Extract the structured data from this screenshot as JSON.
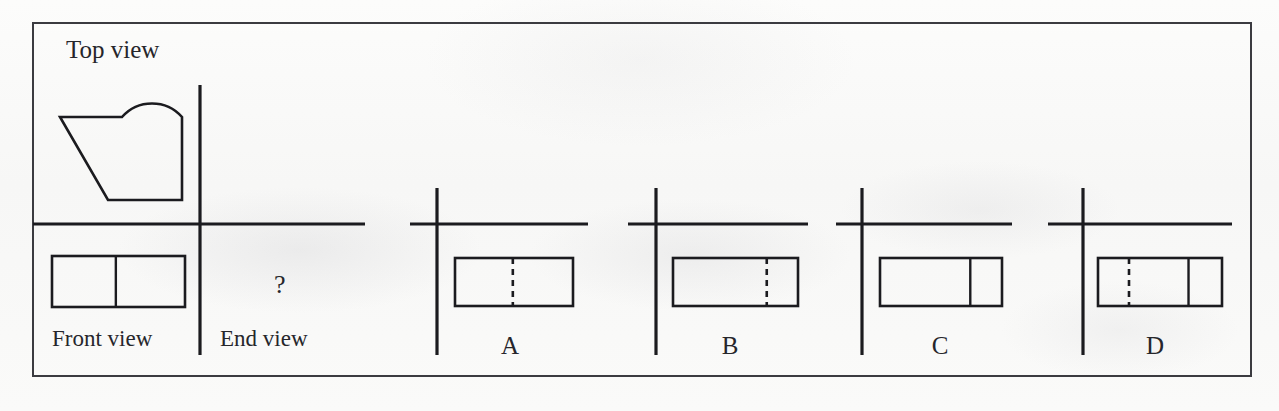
{
  "document": {
    "kind": "orthographic-projection-multiple-choice",
    "background_color": "#fbfbfa",
    "ink_color": "#1b1b1f",
    "border_color": "#3b3b40"
  },
  "given_views": {
    "top_view_label": "Top view",
    "front_view_label": "Front view",
    "end_view_label": "End view",
    "unknown_marker": "?"
  },
  "chart_data": {
    "type": "diagram",
    "title": "Top view",
    "xlabel": "",
    "ylabel": "",
    "grid": false,
    "legend": null
  },
  "top_view": {
    "name": "top-view-profile",
    "description": "plan outline with semicircular boss, concave notch, and tapered diagonal flank",
    "path": "M 60 117 L 122 117 A 40 40 0 0 1 182 117 L 182 200 L 108 200 Z"
  },
  "front_view": {
    "name": "front-view-rectangle",
    "x": 52,
    "y": 256,
    "width": 133,
    "height": 51,
    "divider": {
      "position_pct": 48,
      "style": "solid"
    }
  },
  "axes": {
    "main": {
      "vertical": {
        "x": 200,
        "y1": 85,
        "y2": 355
      },
      "horizontal": {
        "y": 224,
        "x1": 33,
        "x2": 365
      }
    }
  },
  "options": [
    {
      "label": "A",
      "label_x": 510,
      "axis_vertical_x": 437,
      "axis_vertical_y1": 188,
      "axis_vertical_y2": 355,
      "axis_horizontal_y": 224,
      "axis_horizontal_x1": 410,
      "axis_horizontal_x2": 588,
      "rect": {
        "x": 455,
        "y": 258,
        "width": 118,
        "height": 48
      },
      "dividers": [
        {
          "position_pct": 49,
          "style": "hidden"
        }
      ]
    },
    {
      "label": "B",
      "label_x": 730,
      "axis_vertical_x": 656,
      "axis_vertical_y1": 188,
      "axis_vertical_y2": 355,
      "axis_horizontal_y": 224,
      "axis_horizontal_x1": 628,
      "axis_horizontal_x2": 808,
      "rect": {
        "x": 673,
        "y": 258,
        "width": 125,
        "height": 48
      },
      "dividers": [
        {
          "position_pct": 75,
          "style": "hidden"
        }
      ]
    },
    {
      "label": "C",
      "label_x": 940,
      "axis_vertical_x": 862,
      "axis_vertical_y1": 188,
      "axis_vertical_y2": 355,
      "axis_horizontal_y": 224,
      "axis_horizontal_x1": 836,
      "axis_horizontal_x2": 1012,
      "rect": {
        "x": 880,
        "y": 258,
        "width": 122,
        "height": 48
      },
      "dividers": [
        {
          "position_pct": 74,
          "style": "solid"
        }
      ]
    },
    {
      "label": "D",
      "label_x": 1155,
      "axis_vertical_x": 1083,
      "axis_vertical_y1": 188,
      "axis_vertical_y2": 355,
      "axis_horizontal_y": 224,
      "axis_horizontal_x1": 1048,
      "axis_horizontal_x2": 1232,
      "rect": {
        "x": 1098,
        "y": 258,
        "width": 124,
        "height": 48
      },
      "dividers": [
        {
          "position_pct": 25,
          "style": "hidden"
        },
        {
          "position_pct": 73,
          "style": "solid"
        }
      ]
    }
  ],
  "text_positions": {
    "top_view": {
      "x": 66,
      "y": 36
    },
    "front_view": {
      "x": 52,
      "y": 326
    },
    "end_view": {
      "x": 220,
      "y": 326
    },
    "question_mark": {
      "x": 274,
      "y": 270
    },
    "option_label_y": 332
  }
}
